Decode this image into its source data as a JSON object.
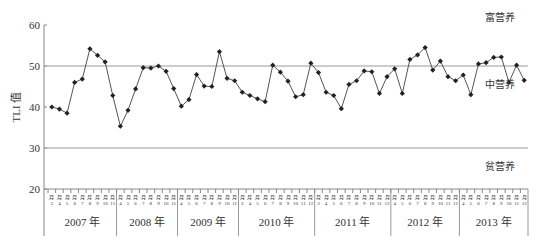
{
  "chart_data": {
    "type": "line",
    "title": "",
    "xlabel": "",
    "ylabel": "TLI 值",
    "ylim": [
      20,
      60
    ],
    "yticks": [
      20,
      30,
      40,
      50,
      60
    ],
    "grid": false,
    "reference_lines": [
      {
        "value": 50,
        "label_above": "富营养"
      },
      {
        "value": 30,
        "label_above": "中营养",
        "label_below": "贫营养"
      }
    ],
    "zone_labels": [
      "富营养",
      "中营养",
      "贫营养"
    ],
    "years": [
      {
        "label": "2007 年",
        "months": [
          "3月",
          "4月",
          "5月",
          "6月",
          "7月",
          "8月",
          "9月",
          "10月",
          "11月"
        ]
      },
      {
        "label": "2008 年",
        "months": [
          "4月",
          "5月",
          "6月",
          "7月",
          "8月",
          "9月",
          "10月",
          "11月"
        ]
      },
      {
        "label": "2009 年",
        "months": [
          "4月",
          "5月",
          "6月",
          "7月",
          "8月",
          "9月",
          "10月",
          "11月"
        ]
      },
      {
        "label": "2010 年",
        "months": [
          "3月",
          "4月",
          "5月",
          "6月",
          "7月",
          "8月",
          "9月",
          "10月",
          "11月",
          "12月"
        ]
      },
      {
        "label": "2011 年",
        "months": [
          "3月",
          "4月",
          "5月",
          "6月",
          "7月",
          "8月",
          "9月",
          "10月",
          "11月",
          "12月"
        ]
      },
      {
        "label": "2012 年",
        "months": [
          "4月",
          "5月",
          "6月",
          "7月",
          "8月",
          "9月",
          "10月",
          "11月",
          "12月"
        ]
      },
      {
        "label": "2013 年",
        "months": [
          "4月",
          "5月",
          "6月",
          "7月",
          "8月",
          "9月",
          "10月",
          "11月",
          "12月"
        ]
      }
    ],
    "series": [
      {
        "name": "TLI",
        "values": [
          40.0,
          39.5,
          38.5,
          46.0,
          46.8,
          54.2,
          52.6,
          51.0,
          42.8,
          35.3,
          39.2,
          44.4,
          49.6,
          49.5,
          50.0,
          48.7,
          44.5,
          40.2,
          41.8,
          47.9,
          45.1,
          45.0,
          53.5,
          47.0,
          46.4,
          43.6,
          42.8,
          42.0,
          41.3,
          50.2,
          48.5,
          46.3,
          42.5,
          43.0,
          50.7,
          48.4,
          43.6,
          42.8,
          39.6,
          45.5,
          46.4,
          48.8,
          48.6,
          43.3,
          47.4,
          49.3,
          43.3,
          51.6,
          52.7,
          54.5,
          49.0,
          51.2,
          47.4,
          46.4,
          47.8,
          43.0,
          50.5,
          50.8,
          52.1,
          52.2,
          46.0,
          50.2,
          46.5
        ]
      }
    ]
  }
}
